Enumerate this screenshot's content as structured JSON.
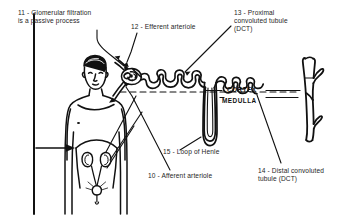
{
  "figure": {
    "line_color": "#111111",
    "text_color": "#262626",
    "background": "#ffffff"
  },
  "labels": {
    "l10": "10 - Afferent arteriole",
    "l11": "11 - Glomerular filtration\nis a passive process",
    "l12": "12 - Efferent arteriole",
    "l13": "13 - Proximal\nconvoluted tubule\n(DCT)",
    "l14": "14 - Distal convoluted\ntubule (DCT)",
    "l15": "15 - Loop of Henle"
  },
  "regions": {
    "cortex": "CORTEX",
    "medulla": "MEDULLA"
  },
  "anatomy": {
    "human_figure": "human-torso-with-urinary-system",
    "kidneys": "kidney-pair",
    "ureters": "ureters",
    "bladder": "urinary-bladder",
    "glomerulus": "glomerulus-capillary-tuft",
    "bowmans_capsule": "bowmans-capsule",
    "proximal_tubule": "proximal-convoluted-tubule",
    "distal_tubule": "distal-convoluted-tubule",
    "loop_of_henle": "loop-of-henle",
    "collecting_duct": "collecting-duct-branch"
  }
}
